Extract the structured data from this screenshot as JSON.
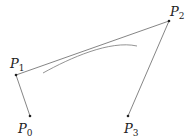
{
  "diagram": {
    "type": "bezier-control-polygon",
    "points": [
      {
        "id": "P0",
        "label": "P",
        "sub": "0",
        "x": 30,
        "y": 116,
        "lx": 18,
        "ly": 133
      },
      {
        "id": "P1",
        "label": "P",
        "sub": "1",
        "x": 16,
        "y": 75,
        "lx": 10,
        "ly": 68
      },
      {
        "id": "P2",
        "label": "P",
        "sub": "2",
        "x": 169,
        "y": 21,
        "lx": 170,
        "ly": 16
      },
      {
        "id": "P3",
        "label": "P",
        "sub": "3",
        "x": 128,
        "y": 116,
        "lx": 124,
        "ly": 133
      }
    ],
    "curve": {
      "d": "M43,73 C70,58 110,40 137,46"
    },
    "colors": {
      "line": "#555555",
      "curve": "#666666",
      "point": "#222222"
    }
  }
}
